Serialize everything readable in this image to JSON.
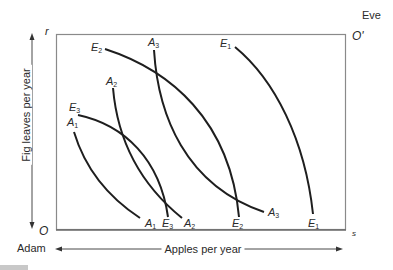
{
  "diagram": {
    "type": "edgeworth-box",
    "origin_adam": "O",
    "origin_eve": "O'",
    "corner_top_left": "r",
    "corner_bottom_right": "s",
    "person_top_right": "Eve",
    "person_bottom_left": "Adam",
    "x_axis_label": "Apples per year",
    "y_axis_label": "Fig leaves per year",
    "colors": {
      "curve": "#1e1e1e",
      "box": "#8a8a8a",
      "text": "#2a2a2a"
    },
    "indifference_curves": {
      "adam": [
        {
          "name": "A",
          "sub": "1",
          "top_label": "A",
          "top_sub": "1",
          "bottom_label": "A",
          "bottom_sub": "1"
        },
        {
          "name": "A",
          "sub": "2",
          "top_label": "A",
          "top_sub": "2",
          "bottom_label": "A",
          "bottom_sub": "2"
        },
        {
          "name": "A",
          "sub": "3",
          "top_label": "A",
          "top_sub": "3",
          "bottom_label": "A",
          "bottom_sub": "3"
        }
      ],
      "eve": [
        {
          "name": "E",
          "sub": "1",
          "top_label": "E",
          "top_sub": "1",
          "bottom_label": "E",
          "bottom_sub": "1"
        },
        {
          "name": "E",
          "sub": "2",
          "top_label": "E",
          "top_sub": "2",
          "bottom_label": "E",
          "bottom_sub": "2"
        },
        {
          "name": "E",
          "sub": "3",
          "top_label": "E",
          "top_sub": "3",
          "bottom_label": "E",
          "bottom_sub": "3"
        }
      ]
    }
  }
}
